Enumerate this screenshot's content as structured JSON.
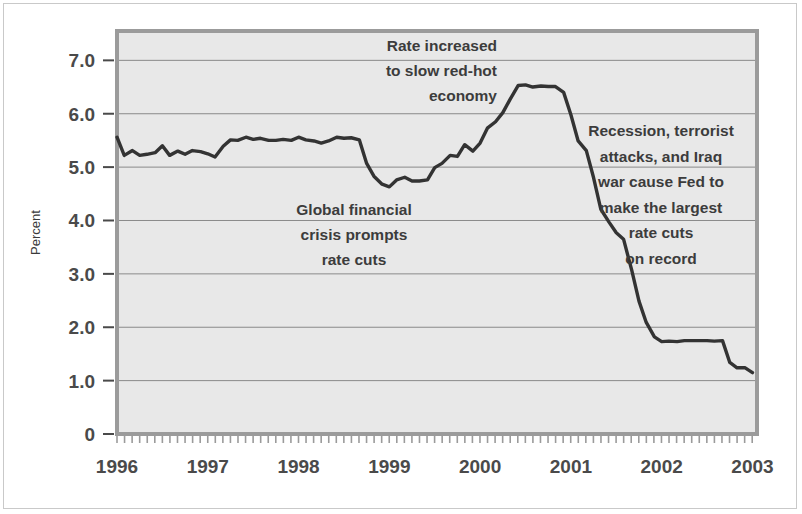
{
  "chart_data": {
    "type": "line",
    "title": "",
    "xlabel": "",
    "ylabel": "Percent",
    "xlim": [
      1996.0,
      2003.05
    ],
    "ylim": [
      0,
      7.55
    ],
    "grid": true,
    "grid_axis": "y",
    "legend": "none",
    "series_name": "Federal funds rate",
    "y_ticks": [
      {
        "value": 7.0,
        "label": "7.0"
      },
      {
        "value": 6.0,
        "label": "6.0"
      },
      {
        "value": 5.0,
        "label": "5.0"
      },
      {
        "value": 4.0,
        "label": "4.0"
      },
      {
        "value": 3.0,
        "label": "3.0"
      },
      {
        "value": 2.0,
        "label": "2.0"
      },
      {
        "value": 1.0,
        "label": "1.0"
      },
      {
        "value": 0.0,
        "label": "0"
      }
    ],
    "x_ticks": [
      {
        "value": 1996,
        "label": "1996"
      },
      {
        "value": 1997,
        "label": "1997"
      },
      {
        "value": 1998,
        "label": "1998"
      },
      {
        "value": 1999,
        "label": "1999"
      },
      {
        "value": 2000,
        "label": "2000"
      },
      {
        "value": 2001,
        "label": "2001"
      },
      {
        "value": 2002,
        "label": "2002"
      },
      {
        "value": 2003,
        "label": "2003"
      }
    ],
    "x_minor_tick_step": 0.0833,
    "x": [
      1996.0,
      1996.08,
      1996.17,
      1996.25,
      1996.33,
      1996.42,
      1996.5,
      1996.58,
      1996.67,
      1996.75,
      1996.83,
      1996.92,
      1997.0,
      1997.08,
      1997.17,
      1997.25,
      1997.33,
      1997.42,
      1997.5,
      1997.58,
      1997.67,
      1997.75,
      1997.83,
      1997.92,
      1998.0,
      1998.08,
      1998.17,
      1998.25,
      1998.33,
      1998.42,
      1998.5,
      1998.58,
      1998.67,
      1998.75,
      1998.83,
      1998.92,
      1999.0,
      1999.08,
      1999.17,
      1999.25,
      1999.33,
      1999.42,
      1999.5,
      1999.58,
      1999.67,
      1999.75,
      1999.83,
      1999.92,
      2000.0,
      2000.08,
      2000.17,
      2000.25,
      2000.33,
      2000.42,
      2000.5,
      2000.58,
      2000.67,
      2000.75,
      2000.83,
      2000.92,
      2001.0,
      2001.08,
      2001.17,
      2001.25,
      2001.33,
      2001.42,
      2001.5,
      2001.58,
      2001.67,
      2001.75,
      2001.83,
      2001.92,
      2002.0,
      2002.08,
      2002.17,
      2002.25,
      2002.33,
      2002.42,
      2002.5,
      2002.58,
      2002.67,
      2002.75,
      2002.83,
      2002.92,
      2003.0
    ],
    "values": [
      5.56,
      5.22,
      5.31,
      5.22,
      5.24,
      5.27,
      5.4,
      5.22,
      5.3,
      5.24,
      5.31,
      5.29,
      5.25,
      5.19,
      5.39,
      5.51,
      5.5,
      5.56,
      5.52,
      5.54,
      5.5,
      5.5,
      5.52,
      5.5,
      5.56,
      5.51,
      5.49,
      5.45,
      5.49,
      5.56,
      5.54,
      5.55,
      5.51,
      5.07,
      4.83,
      4.68,
      4.63,
      4.76,
      4.81,
      4.74,
      4.74,
      4.76,
      4.99,
      5.07,
      5.22,
      5.2,
      5.42,
      5.3,
      5.45,
      5.73,
      5.85,
      6.02,
      6.27,
      6.53,
      6.54,
      6.5,
      6.52,
      6.51,
      6.51,
      6.4,
      5.98,
      5.49,
      5.31,
      4.8,
      4.21,
      3.97,
      3.77,
      3.65,
      3.07,
      2.49,
      2.09,
      1.82,
      1.73,
      1.74,
      1.73,
      1.75,
      1.75,
      1.75,
      1.75,
      1.74,
      1.75,
      1.34,
      1.24,
      1.24,
      1.15
    ]
  },
  "annotations": [
    {
      "name": "annotation-rate-increased",
      "align": "right",
      "anchor_x": 497,
      "anchor_y": 51,
      "line_height": 25,
      "lines": [
        "Rate increased",
        "to slow red-hot",
        "economy"
      ]
    },
    {
      "name": "annotation-global-financial-crisis",
      "align": "center",
      "anchor_x": 354,
      "anchor_y": 215,
      "line_height": 25,
      "lines": [
        "Global financial",
        "crisis prompts",
        "rate cuts"
      ]
    },
    {
      "name": "annotation-recession-rate-cuts",
      "align": "center",
      "anchor_x": 661,
      "anchor_y": 136,
      "line_height": 25.5,
      "lines": [
        "Recession, terrorist",
        "attacks, and Iraq",
        "war cause Fed to",
        "make the largest",
        "rate cuts",
        "on record"
      ]
    }
  ],
  "colors": {
    "page_background": "#ffffff",
    "plot_background": "#e8e8e8",
    "plot_frame": "#9b9b9b",
    "gridline": "#8a8a8a",
    "data_line": "#333333",
    "tick_label": "#4a4a4a",
    "annotation_text": "#3c3c3c",
    "axis_title": "#3a3a3a",
    "outer_border": "#c9c9c9"
  },
  "geometry": {
    "plot_left": 117,
    "plot_right": 757,
    "plot_top": 31,
    "plot_bottom": 434
  }
}
